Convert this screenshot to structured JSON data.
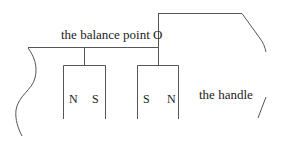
{
  "diagram": {
    "title_label": "the balance point O",
    "handle_label": "the handle",
    "left_magnet": {
      "left_pole": "N",
      "right_pole": "S"
    },
    "right_magnet": {
      "left_pole": "S",
      "right_pole": "N"
    },
    "colors": {
      "line": "#555555",
      "text": "#222222",
      "background": "#ffffff"
    }
  }
}
